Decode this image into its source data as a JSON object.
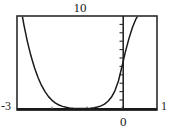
{
  "graph": {
    "title": "",
    "labels": {
      "y_max": "10",
      "x_min": "-3",
      "x_max": "1",
      "origin": "0"
    },
    "colors": {
      "frame": "#2b2b2b",
      "curve": "#1a1a1a",
      "axis": "#1a1a1a",
      "background": "#ffffff"
    }
  },
  "chart_data": {
    "type": "line",
    "title": "",
    "xlabel": "",
    "ylabel": "",
    "xlim": [
      -3,
      1
    ],
    "ylim": [
      0,
      10
    ],
    "grid": false,
    "legend": null,
    "x_ticks": [
      -3,
      -2,
      -1,
      0,
      1
    ],
    "y_ticks": [
      0,
      1,
      2,
      3,
      4,
      5,
      6,
      7,
      8,
      9,
      10
    ],
    "x_tick_labels": [
      "-3",
      "",
      "",
      "0",
      "1"
    ],
    "y_tick_labels": [
      "",
      "",
      "",
      "",
      "",
      "",
      "",
      "",
      "",
      "",
      "10"
    ],
    "series": [
      {
        "name": "curve",
        "x": [
          -3.0,
          -2.9,
          -2.8,
          -2.7,
          -2.6,
          -2.5,
          -2.4,
          -2.3,
          -2.2,
          -2.1,
          -2.0,
          -1.9,
          -1.8,
          -1.7,
          -1.6,
          -1.5,
          -1.4,
          -1.3,
          -1.2,
          -1.1,
          -1.0,
          -0.9,
          -0.8,
          -0.7,
          -0.6,
          -0.5,
          -0.4,
          -0.3,
          -0.2,
          -0.1,
          0.0,
          0.1,
          0.2,
          0.3,
          0.4,
          0.5,
          0.6,
          0.7,
          0.8,
          0.9,
          1.0
        ],
        "y": [
          13.5,
          11.1,
          9.0,
          7.2,
          5.7,
          4.45,
          3.4,
          2.55,
          1.88,
          1.35,
          0.95,
          0.66,
          0.45,
          0.3,
          0.2,
          0.14,
          0.1,
          0.08,
          0.07,
          0.07,
          0.08,
          0.11,
          0.16,
          0.24,
          0.36,
          0.55,
          0.85,
          1.3,
          2.0,
          3.05,
          4.6,
          6.2,
          7.6,
          8.8,
          9.7,
          10.3,
          10.8,
          11.2,
          11.5,
          11.8,
          12.0
        ]
      }
    ]
  }
}
